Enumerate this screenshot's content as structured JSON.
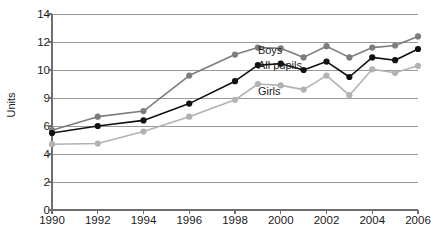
{
  "chart_data": {
    "type": "line",
    "title": "",
    "xlabel": "",
    "ylabel": "Units",
    "x": [
      1990,
      1991,
      1992,
      1993,
      1994,
      1995,
      1996,
      1997,
      1998,
      1999,
      2000,
      2001,
      2002,
      2003,
      2004,
      2005,
      2006
    ],
    "xtick_labels": [
      "1990",
      "1992",
      "1994",
      "1996",
      "1998",
      "2000",
      "2002",
      "2004",
      "2006"
    ],
    "xtick_values": [
      1990,
      1992,
      1994,
      1996,
      1998,
      2000,
      2002,
      2004,
      2006
    ],
    "ytick_labels": [
      "0",
      "2",
      "4",
      "6",
      "9",
      "10",
      "12",
      "14"
    ],
    "ytick_values": [
      0,
      2,
      4,
      6,
      9,
      10,
      12,
      14
    ],
    "y_axis_note": "non-linear axis: ticks evenly spaced despite unequal value steps",
    "ylim": [
      0,
      14
    ],
    "grid": "horizontal",
    "legend_position": "inline-labels",
    "series": [
      {
        "name": "Boys",
        "color": "#7d7d7d",
        "label_x": 1999.0,
        "label_y": 11.35,
        "points": [
          {
            "x": 1990,
            "y": 5.7
          },
          {
            "x": 1992,
            "y": 7.0
          },
          {
            "x": 1994,
            "y": 7.6
          },
          {
            "x": 1996,
            "y": 9.8
          },
          {
            "x": 1998,
            "y": 11.1
          },
          {
            "x": 1999,
            "y": 11.6
          },
          {
            "x": 2000,
            "y": 11.55
          },
          {
            "x": 2001,
            "y": 10.9
          },
          {
            "x": 2002,
            "y": 11.7
          },
          {
            "x": 2003,
            "y": 10.9
          },
          {
            "x": 2004,
            "y": 11.6
          },
          {
            "x": 2005,
            "y": 11.75
          },
          {
            "x": 2006,
            "y": 12.4
          }
        ]
      },
      {
        "name": "All pupils",
        "color": "#111111",
        "label_x": 1999.0,
        "label_y": 10.25,
        "points": [
          {
            "x": 1990,
            "y": 5.5
          },
          {
            "x": 1992,
            "y": 6.0
          },
          {
            "x": 1994,
            "y": 6.6
          },
          {
            "x": 1996,
            "y": 8.4
          },
          {
            "x": 1998,
            "y": 9.6
          },
          {
            "x": 1999,
            "y": 10.35
          },
          {
            "x": 2000,
            "y": 10.45
          },
          {
            "x": 2001,
            "y": 10.0
          },
          {
            "x": 2002,
            "y": 10.6
          },
          {
            "x": 2003,
            "y": 9.75
          },
          {
            "x": 2004,
            "y": 10.9
          },
          {
            "x": 2005,
            "y": 10.7
          },
          {
            "x": 2006,
            "y": 11.5
          }
        ]
      },
      {
        "name": "Girls",
        "color": "#b2b2b2",
        "label_x": 1999.0,
        "label_y": 9.2,
        "points": [
          {
            "x": 1990,
            "y": 4.7
          },
          {
            "x": 1992,
            "y": 4.75
          },
          {
            "x": 1994,
            "y": 5.6
          },
          {
            "x": 1996,
            "y": 7.0
          },
          {
            "x": 1998,
            "y": 8.8
          },
          {
            "x": 1999,
            "y": 9.5
          },
          {
            "x": 2000,
            "y": 9.45
          },
          {
            "x": 2001,
            "y": 9.3
          },
          {
            "x": 2002,
            "y": 9.8
          },
          {
            "x": 2003,
            "y": 9.1
          },
          {
            "x": 2004,
            "y": 10.05
          },
          {
            "x": 2005,
            "y": 9.9
          },
          {
            "x": 2006,
            "y": 10.3
          }
        ]
      }
    ]
  }
}
